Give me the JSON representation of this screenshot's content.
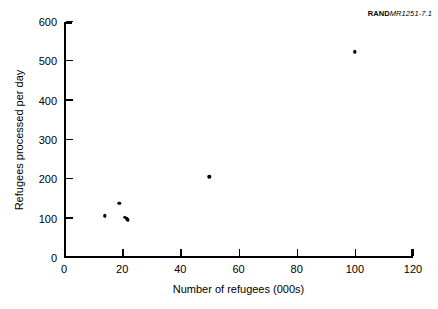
{
  "figure_id": {
    "brand": "RAND",
    "number": "MR1251-7.1"
  },
  "chart_data": {
    "type": "scatter",
    "title": "",
    "xlabel": "Number of refugees (000s)",
    "ylabel": "Refugees processed per day",
    "xlim": [
      0,
      120
    ],
    "ylim": [
      0,
      600
    ],
    "xticks": [
      0,
      20,
      40,
      60,
      80,
      100,
      120
    ],
    "yticks": [
      0,
      100,
      200,
      300,
      400,
      500,
      600
    ],
    "xticklabels": [
      "0",
      "20",
      "40",
      "60",
      "80",
      "100",
      "120"
    ],
    "yticklabels": [
      "0",
      "100",
      "200",
      "300",
      "400",
      "500",
      "600"
    ],
    "grid": false,
    "legend": null,
    "marker": "filled-circle",
    "marker_color": "#000000",
    "points": [
      {
        "x": 14,
        "y": 108
      },
      {
        "x": 19,
        "y": 140
      },
      {
        "x": 21,
        "y": 104
      },
      {
        "x": 21.5,
        "y": 100
      },
      {
        "x": 22,
        "y": 97
      },
      {
        "x": 50,
        "y": 207
      },
      {
        "x": 100,
        "y": 525
      }
    ]
  }
}
